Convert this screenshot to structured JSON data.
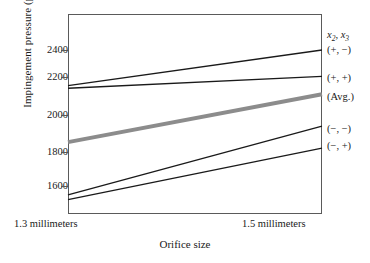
{
  "chart_data": {
    "type": "line",
    "title": "",
    "xlabel": "Orifice size",
    "ylabel": "Impingement pressure (psi)",
    "x": [
      1.3,
      1.5
    ],
    "xtick_labels": [
      "1.3 millimeters",
      "1.5 millimeters"
    ],
    "ytick_values": [
      1600,
      1800,
      2000,
      2200,
      2400
    ],
    "ytick_labels": [
      "1600",
      "2200",
      "2000",
      "2200",
      "2400"
    ],
    "ylim": [
      1500,
      2500
    ],
    "xlim": [
      1.3,
      1.5
    ],
    "grid": false,
    "legend_position": "right-outside",
    "legend_header": "x2, x3",
    "series": [
      {
        "name": "(+, −)",
        "values": [
          2190,
          2400
        ],
        "color": "#1a1a1a",
        "width": 1.3
      },
      {
        "name": "(+, +)",
        "values": [
          2175,
          2245
        ],
        "color": "#1a1a1a",
        "width": 1.3
      },
      {
        "name": "(Avg.)",
        "values": [
          1858,
          2140
        ],
        "color": "#8c8c8c",
        "width": 4.0
      },
      {
        "name": "(−, −)",
        "values": [
          1548,
          1952
        ],
        "color": "#1a1a1a",
        "width": 1.3
      },
      {
        "name": "(−, +)",
        "values": [
          1520,
          1823
        ],
        "color": "#1a1a1a",
        "width": 1.3
      }
    ]
  },
  "axis": {
    "y_title": "Impingement pressure (psi)",
    "x_title": "Orifice size",
    "yticks": [
      {
        "label": "2400"
      },
      {
        "label": "2200"
      },
      {
        "label": "2000"
      },
      {
        "label": "1800"
      },
      {
        "label": "1600"
      }
    ],
    "xticks": [
      {
        "label": "1.3 millimeters"
      },
      {
        "label": "1.5 millimeters"
      }
    ]
  },
  "legend": {
    "header_main": "x",
    "header_sub1": "2",
    "header_mid": ", x",
    "header_sub2": "3",
    "entries": [
      {
        "label": "(+, −)"
      },
      {
        "label": "(+, +)"
      },
      {
        "label": "(Avg.)"
      },
      {
        "label": "(−, −)"
      },
      {
        "label": "(−, +)"
      }
    ]
  },
  "colors": {
    "line": "#1a1a1a",
    "avg_line": "#8c8c8c",
    "frame": "#5a5a5a",
    "background": "#ffffff"
  }
}
